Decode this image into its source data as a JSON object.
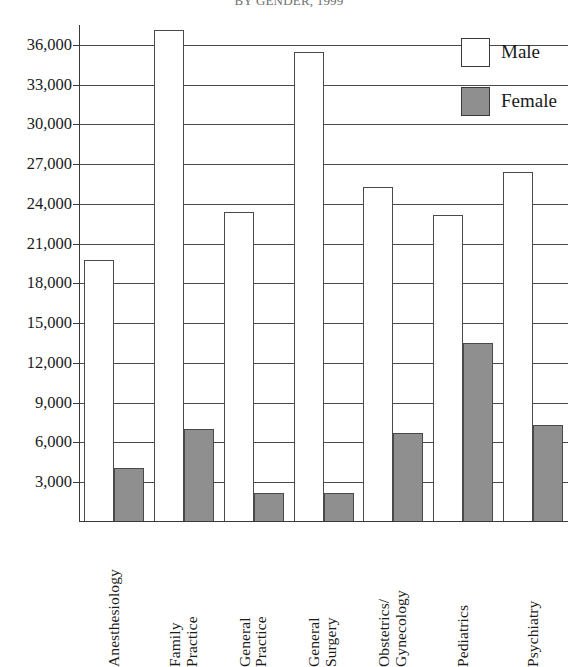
{
  "chart_data": {
    "type": "bar",
    "title": "BY GENDER, 1999",
    "xlabel": "",
    "ylabel": "",
    "ylim": [
      0,
      37500
    ],
    "ytick_step": 3000,
    "ytick_labels": [
      "3,000",
      "6,000",
      "9,000",
      "12,000",
      "15,000",
      "18,000",
      "21,000",
      "24,000",
      "27,000",
      "30,000",
      "33,000",
      "36,000"
    ],
    "ytick_values": [
      3000,
      6000,
      9000,
      12000,
      15000,
      18000,
      21000,
      24000,
      27000,
      30000,
      33000,
      36000
    ],
    "grid": true,
    "legend_position": "top-right",
    "categories": [
      "Anesthesiology",
      "Family Practice",
      "General Practice",
      "General Surgery",
      "Obstetrics/Gynecology",
      "Pediatrics",
      "Psychiatry"
    ],
    "category_lines": [
      [
        "Anesthesiology"
      ],
      [
        "Family",
        "Practice"
      ],
      [
        "General",
        "Practice"
      ],
      [
        "General",
        "Surgery"
      ],
      [
        "Obstetrics/",
        "Gynecology"
      ],
      [
        "Pediatrics"
      ],
      [
        "Psychiatry"
      ]
    ],
    "series": [
      {
        "name": "Male",
        "color": "#ffffff",
        "values": [
          19800,
          37100,
          23400,
          35500,
          25300,
          23200,
          26400
        ]
      },
      {
        "name": "Female",
        "color": "#8f8f8f",
        "values": [
          4100,
          7000,
          2200,
          2200,
          6700,
          13500,
          7300
        ]
      }
    ]
  },
  "legend": {
    "items": [
      {
        "label": "Male",
        "swatch": "male"
      },
      {
        "label": "Female",
        "swatch": "female"
      }
    ]
  },
  "colors": {
    "male_fill": "#ffffff",
    "female_fill": "#8f8f8f",
    "axis": "#3a3a3a",
    "grid": "#4a4a4a",
    "text": "#1a1a1a"
  }
}
